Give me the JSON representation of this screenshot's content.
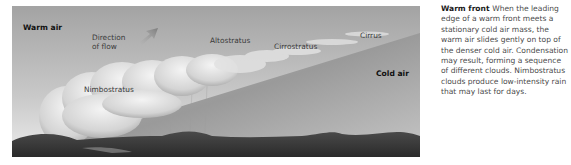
{
  "figure": {
    "labels": {
      "warm_air": "Warm air",
      "direction_line1": "Direction",
      "direction_line2": "of flow",
      "altostratus": "Altostratus",
      "cirrostratus": "Cirrostratus",
      "cirrus": "Cirrus",
      "nimbostratus": "Nimbostratus",
      "cold_air": "Cold air"
    },
    "icons": {
      "flow_arrow": "arrow-up-right-icon"
    },
    "colors": {
      "sky_top": "#9a9a9a",
      "sky_bottom": "#e6e6e6",
      "cold_wedge": "#8c8c8c",
      "ground": "#3c3c3c",
      "cloud": "#e8e8e8"
    }
  },
  "caption": {
    "title": "Warm front",
    "body": "When the leading edge of a warm front meets a stationary cold air mass, the warm air slides gently on top of the denser cold air. Condensation may result, forming a sequence of different clouds. Nimbostratus clouds produce low-intensity rain that may last for days."
  }
}
